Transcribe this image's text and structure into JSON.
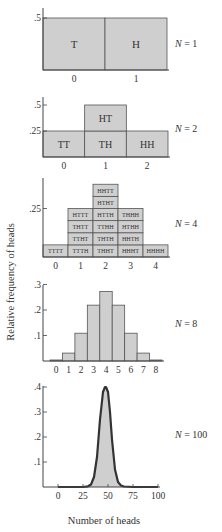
{
  "colors": {
    "bar_fill": "#cfcfcf",
    "bar_stroke": "#555555",
    "axis": "#444444",
    "curve_stroke": "#333333",
    "text": "#333333"
  },
  "y_axis_label": "Relative frequency of heads",
  "x_axis_label": "Number of heads",
  "chart_data": [
    {
      "type": "bar",
      "title": "N = 1",
      "n_label": "N = 1",
      "categories": [
        "0",
        "1"
      ],
      "values": [
        0.5,
        0.5
      ],
      "cell_labels": [
        [
          "T"
        ],
        [
          "H"
        ]
      ],
      "yticks": [
        {
          "value": 0.5,
          "label": ".5"
        }
      ],
      "ylim": [
        0,
        0.5
      ],
      "xlabel": "",
      "ylabel": "Relative frequency of heads"
    },
    {
      "type": "bar",
      "title": "N = 2",
      "n_label": "N = 2",
      "categories": [
        "0",
        "1",
        "2"
      ],
      "values": [
        0.25,
        0.5,
        0.25
      ],
      "cell_labels": [
        [
          "TT"
        ],
        [
          "TH",
          "HT"
        ],
        [
          "HH"
        ]
      ],
      "yticks": [
        {
          "value": 0.5,
          "label": ".5"
        },
        {
          "value": 0.25,
          "label": ".25"
        }
      ],
      "ylim": [
        0,
        0.5
      ],
      "xlabel": "",
      "ylabel": "Relative frequency of heads"
    },
    {
      "type": "bar",
      "title": "N = 4",
      "n_label": "N = 4",
      "categories": [
        "0",
        "1",
        "2",
        "3",
        "4"
      ],
      "values": [
        0.0625,
        0.25,
        0.375,
        0.25,
        0.0625
      ],
      "cell_labels": [
        [
          "TTTT"
        ],
        [
          "TTTH",
          "TTHT",
          "THTT",
          "HTTT"
        ],
        [
          "THHT",
          "THTH",
          "TTHH",
          "HTTH",
          "HTHT",
          "HHTT"
        ],
        [
          "HHHT",
          "HHTH",
          "HTHH",
          "THHH"
        ],
        [
          "HHHH"
        ]
      ],
      "yticks": [
        {
          "value": 0.25,
          "label": ".25"
        }
      ],
      "ylim": [
        0,
        0.375
      ],
      "xlabel": "",
      "ylabel": "Relative frequency of heads"
    },
    {
      "type": "bar",
      "title": "N = 8",
      "n_label": "N = 8",
      "categories": [
        "0",
        "1",
        "2",
        "3",
        "4",
        "5",
        "6",
        "7",
        "8"
      ],
      "values": [
        0.004,
        0.031,
        0.109,
        0.219,
        0.273,
        0.219,
        0.109,
        0.031,
        0.004
      ],
      "yticks": [
        {
          "value": 0.3,
          "label": ".3"
        },
        {
          "value": 0.2,
          "label": ".2"
        },
        {
          "value": 0.1,
          "label": ".1"
        }
      ],
      "ylim": [
        0,
        0.3
      ],
      "xlabel": "",
      "ylabel": "Relative frequency of heads"
    },
    {
      "type": "area",
      "title": "N = 100",
      "n_label": "N = 100",
      "x": [
        0,
        25,
        30,
        33,
        36,
        39,
        42,
        45,
        47,
        48,
        50,
        52,
        54,
        57,
        60,
        63,
        66,
        75,
        100
      ],
      "y": [
        0,
        0,
        0.003,
        0.01,
        0.04,
        0.12,
        0.27,
        0.38,
        0.4,
        0.4,
        0.38,
        0.3,
        0.19,
        0.07,
        0.02,
        0.006,
        0.002,
        0,
        0
      ],
      "xticks": [
        "0",
        "25",
        "50",
        "75",
        "100"
      ],
      "yticks": [
        {
          "value": 0.4,
          "label": ".4"
        },
        {
          "value": 0.3,
          "label": ".3"
        },
        {
          "value": 0.2,
          "label": ".2"
        },
        {
          "value": 0.1,
          "label": ".1"
        }
      ],
      "ylim": [
        0,
        0.4
      ],
      "xlim": [
        0,
        100
      ],
      "xlabel": "Number of heads",
      "ylabel": "Relative frequency of heads"
    }
  ]
}
